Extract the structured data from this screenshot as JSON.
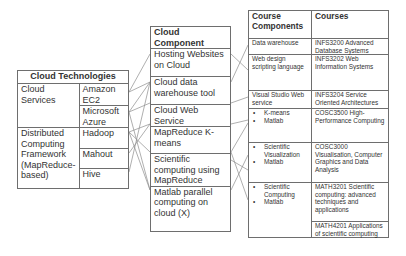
{
  "cloud_technologies": {
    "title": "Cloud Technologies",
    "groups": [
      {
        "label": "Cloud Services",
        "items": [
          "Amazon EC2",
          "Microsoft Azure"
        ]
      },
      {
        "label": "Distributed Computing Framework (MapReduce-based)",
        "items": [
          "Hadoop",
          "Mahout",
          "Hive"
        ]
      }
    ]
  },
  "cloud_component": {
    "title": "Cloud Component",
    "items": [
      "Hosting Websites on Cloud",
      "Cloud data warehouse tool",
      "Cloud Web Service",
      "MapReduce K-means",
      "Scientific computing using MapReduce",
      "Matlab parallel computing on cloud (X)"
    ]
  },
  "courses_table": {
    "headers": [
      "Course Components",
      "Courses"
    ],
    "rows": [
      {
        "component": "Data warehouse",
        "courses": [
          "INFS3200 Advanced Database Systems"
        ]
      },
      {
        "component": "Web design scripting language",
        "courses": [
          "INFS3202 Web Information Systems"
        ]
      },
      {
        "component": "Visual Studio Web service",
        "courses": [
          "INFS3204 Service Oriented Architectures"
        ]
      },
      {
        "component_bullets": [
          "K-means",
          "Matlab"
        ],
        "courses": [
          "COSC3500 High-Performance Computing"
        ]
      },
      {
        "component_bullets": [
          "Scientific Visualization",
          "Matlab"
        ],
        "courses": [
          "COSC3000 Visualisation, Computer Graphics and Data Analysis"
        ]
      },
      {
        "component_bullets": [
          "Scientific Computing",
          "Matlab"
        ],
        "courses": [
          "MATH3201 Scientific computing: advanced techniques and applications",
          "MATH4201 Applications of scientific computing"
        ]
      }
    ]
  },
  "colors": {
    "border": "#6e6e6e",
    "line": "#8a8a8a",
    "text": "#333333"
  }
}
